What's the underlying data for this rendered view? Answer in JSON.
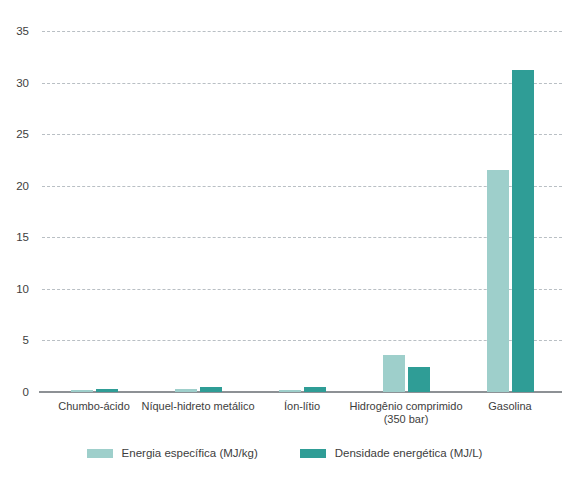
{
  "chart_data": {
    "type": "bar",
    "title": "",
    "subtitle": "",
    "xlabel": "",
    "ylabel": "",
    "ylim": [
      0,
      35
    ],
    "yticks": [
      0,
      5,
      10,
      15,
      20,
      25,
      30,
      35
    ],
    "ytick_labels": [
      "0",
      "5",
      "10",
      "15",
      "20",
      "25",
      "30",
      "35"
    ],
    "grid": true,
    "legend_position": "bottom",
    "categories": [
      "Chumbo-ácido",
      "Níquel-hidreto metálico",
      "Íon-lítio",
      "Hidrogênio comprimido\n(350 bar)",
      "Gasolina"
    ],
    "series": [
      {
        "name": "Energia específica (MJ/kg)",
        "color": "#9ecfcb",
        "values": [
          0.15,
          0.3,
          0.2,
          3.6,
          21.5
        ]
      },
      {
        "name": "Densidade energética (MJ/L)",
        "color": "#2f9d96",
        "values": [
          0.3,
          0.5,
          0.5,
          2.4,
          31.2
        ]
      }
    ]
  },
  "colors": {
    "specific_energy": "#9ecfcb",
    "energy_density": "#2f9d96",
    "gridline": "#b9bfc4",
    "axis": "#8d9195",
    "text": "#3d3d3d",
    "background": "#ffffff"
  }
}
